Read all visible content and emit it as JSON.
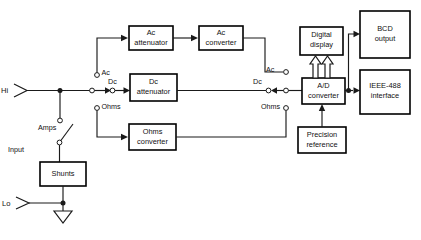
{
  "diagram": {
    "blocks": [
      {
        "id": "ac_attenuator",
        "line1": "Ac",
        "line2": "attenuator"
      },
      {
        "id": "ac_converter",
        "line1": "Ac",
        "line2": "converter"
      },
      {
        "id": "dc_attenuator",
        "line1": "Dc",
        "line2": "attenuator"
      },
      {
        "id": "ohms_converter",
        "line1": "Ohms",
        "line2": "converter"
      },
      {
        "id": "digital_display",
        "line1": "Digital",
        "line2": "display"
      },
      {
        "id": "ad_converter",
        "line1": "A/D",
        "line2": "converter"
      },
      {
        "id": "precision_ref",
        "line1": "Precision",
        "line2": "reference"
      },
      {
        "id": "bcd_output",
        "line1": "BCD",
        "line2": "output"
      },
      {
        "id": "ieee_interface",
        "line1": "IEEE-488",
        "line2": "interface"
      },
      {
        "id": "shunts",
        "line1": "Shunts",
        "line2": ""
      }
    ],
    "terminals": {
      "hi": "Hi",
      "lo": "Lo",
      "input": "Input"
    },
    "switches": {
      "amps": "Amps",
      "left_contacts": {
        "ac": "Ac",
        "dc": "Dc",
        "ohms": "Ohms"
      },
      "right_contacts": {
        "ac": "Ac",
        "dc": "Dc",
        "ohms": "Ohms"
      }
    },
    "colors": {
      "line": "#1a1a1a",
      "box_fill": "#ffffff",
      "background": "#ffffff",
      "text": "#111111"
    }
  }
}
